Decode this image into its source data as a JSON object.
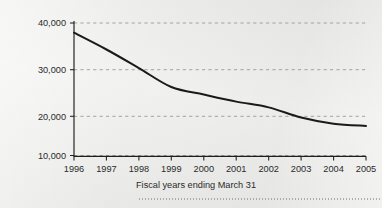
{
  "chart_data": {
    "type": "line",
    "title": "",
    "subtitle": "",
    "xlabel": "Fiscal years ending March 31",
    "ylabel": "",
    "categories": [
      "1996",
      "1997",
      "1998",
      "1999",
      "2000",
      "2001",
      "2002",
      "2003",
      "2004",
      "2005"
    ],
    "x": [
      1996,
      1997,
      1998,
      1999,
      2000,
      2001,
      2002,
      2003,
      2004,
      2005
    ],
    "values": [
      37800,
      34000,
      29800,
      25500,
      23800,
      22200,
      20900,
      18600,
      17200,
      16700
    ],
    "series": [
      {
        "name": "",
        "values": [
          37800,
          34000,
          29800,
          25500,
          23800,
          22200,
          20900,
          18600,
          17200,
          16700
        ]
      }
    ],
    "ylim": [
      10000,
      40000
    ],
    "xlim": [
      1996,
      2005
    ],
    "ytick_values": [
      10000,
      20000,
      30000,
      40000
    ],
    "ytick_labels": [
      "10,000",
      "20,000",
      "30,000",
      "40,000"
    ],
    "grid": "horizontal-dashed",
    "legend": "none",
    "line_color": "#1a1a1a",
    "grid_color": "#9a9a9a",
    "axis_color": "#1e1e1e",
    "background_color": "#ececea",
    "annotations": []
  },
  "axis": {
    "x_title": "Fiscal years ending March 31",
    "y_ticks": [
      {
        "label": "40,000",
        "value": 40000
      },
      {
        "label": "30,000",
        "value": 30000
      },
      {
        "label": "20,000",
        "value": 20000
      },
      {
        "label": "10,000",
        "value": 10000
      }
    ],
    "x_ticks": [
      {
        "label": "1996"
      },
      {
        "label": "1997"
      },
      {
        "label": "1998"
      },
      {
        "label": "1999"
      },
      {
        "label": "2000"
      },
      {
        "label": "2001"
      },
      {
        "label": "2002"
      },
      {
        "label": "2003"
      },
      {
        "label": "2004"
      },
      {
        "label": "2005"
      }
    ]
  }
}
